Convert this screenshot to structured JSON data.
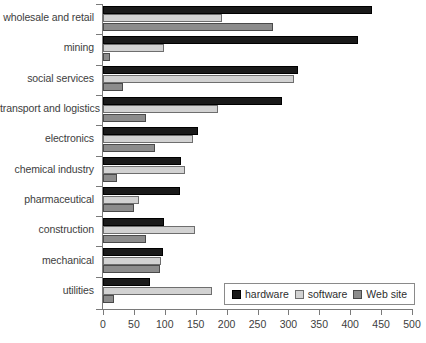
{
  "chart_data": {
    "type": "bar",
    "orientation": "horizontal",
    "title": "",
    "xlabel": "",
    "ylabel": "",
    "xlim": [
      0,
      500
    ],
    "xticks": [
      0,
      50,
      100,
      150,
      200,
      250,
      300,
      350,
      400,
      450,
      500
    ],
    "grid": false,
    "legend_position": "bottom-right",
    "categories": [
      "wholesale and retail",
      "mining",
      "social services",
      "transport and logistics",
      "electronics",
      "chemical industry",
      "pharmaceutical",
      "construction",
      "mechanical",
      "utilities"
    ],
    "series": [
      {
        "name": "hardware",
        "color": "#1a1a1a",
        "values": [
          435,
          413,
          315,
          290,
          154,
          126,
          125,
          99,
          97,
          76
        ]
      },
      {
        "name": "software",
        "color": "#d2d2d2",
        "values": [
          192,
          99,
          309,
          186,
          146,
          133,
          58,
          149,
          94,
          176
        ]
      },
      {
        "name": "Web site",
        "color": "#8c8c8c",
        "values": [
          275,
          12,
          32,
          70,
          84,
          23,
          50,
          70,
          92,
          18
        ]
      }
    ]
  },
  "legend": {
    "entries": [
      {
        "label": "hardware"
      },
      {
        "label": "software"
      },
      {
        "label": "Web site"
      }
    ]
  },
  "axis": {
    "x_tick_labels": [
      "0",
      "50",
      "100",
      "150",
      "200",
      "250",
      "300",
      "350",
      "400",
      "450",
      "500"
    ]
  }
}
